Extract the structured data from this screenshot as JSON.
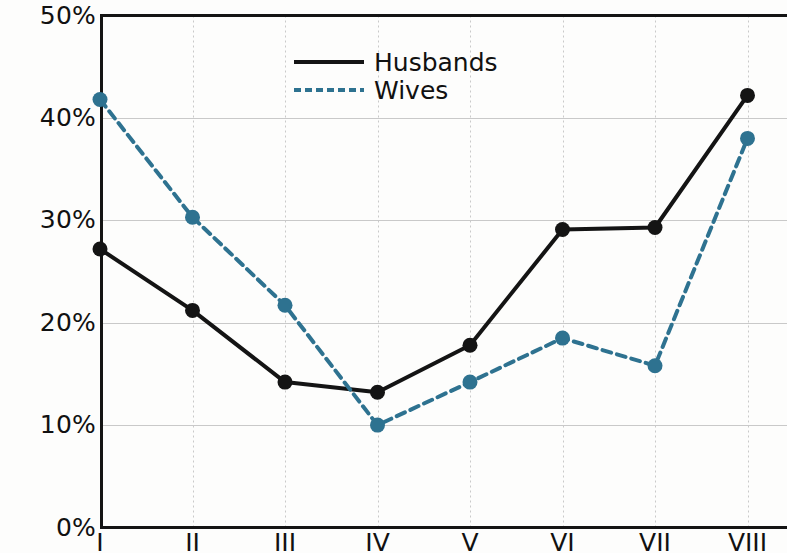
{
  "chart_data": {
    "type": "line",
    "title": "",
    "subtitle": "",
    "xlabel": "",
    "ylabel": "",
    "categories": [
      "I",
      "II",
      "III",
      "IV",
      "V",
      "VI",
      "VII",
      "VIII"
    ],
    "series": [
      {
        "name": "Husbands",
        "values": [
          27.2,
          21.2,
          14.2,
          13.2,
          17.8,
          29.1,
          29.3,
          42.2
        ],
        "color": "#141414",
        "style": "solid",
        "marker": "circle"
      },
      {
        "name": "Wives",
        "values": [
          41.8,
          30.3,
          21.7,
          10.0,
          14.2,
          18.5,
          15.8,
          38.0
        ],
        "color": "#2e7290",
        "style": "dashed",
        "marker": "circle"
      }
    ],
    "ylim": [
      0,
      50
    ],
    "yticks": [
      0,
      10,
      20,
      30,
      40,
      50
    ],
    "ytick_labels": [
      "0%",
      "10%",
      "20%",
      "30%",
      "40%",
      "50%"
    ],
    "xtick_labels": [
      "I",
      "II",
      "III",
      "IV",
      "V",
      "VI",
      "VII",
      "VIII"
    ],
    "grid": true,
    "grid_color": "#c9c9c9",
    "legend_position": "upper-center-left",
    "axis_color": "#141414",
    "background": "#fdfdfc"
  },
  "legend": {
    "entries": [
      {
        "label": "Husbands"
      },
      {
        "label": "Wives"
      }
    ]
  },
  "axes": {
    "y_labels": [
      "50%",
      "40%",
      "30%",
      "20%",
      "10%",
      "0%"
    ],
    "x_labels": [
      "I",
      "II",
      "III",
      "IV",
      "V",
      "VI",
      "VII",
      "VIII"
    ]
  }
}
